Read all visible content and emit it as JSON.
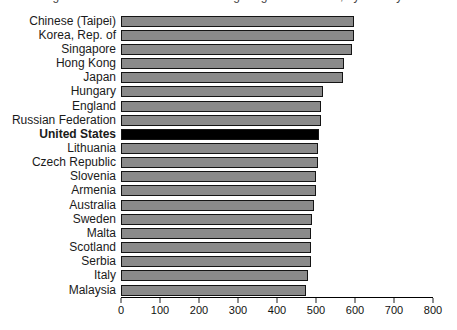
{
  "cropped_title": "Average mathematics scale scores of eighth-grade students, by country: 2007",
  "chart_data": {
    "type": "bar",
    "orientation": "horizontal",
    "title": "",
    "xlabel": "",
    "ylabel": "",
    "xlim": [
      0,
      800
    ],
    "x_ticks": [
      0,
      100,
      200,
      300,
      400,
      500,
      600,
      700,
      800
    ],
    "grid": "off",
    "legend": "none",
    "bar_color": "#8a8a8a",
    "bar_border_color": "#141414",
    "highlight_category": "United States",
    "highlight_color": "#000000",
    "categories": [
      "Chinese (Taipei)",
      "Korea, Rep. of",
      "Singapore",
      "Hong Kong",
      "Japan",
      "Hungary",
      "England",
      "Russian Federation",
      "United States",
      "Lithuania",
      "Czech Republic",
      "Slovenia",
      "Armenia",
      "Australia",
      "Sweden",
      "Malta",
      "Scotland",
      "Serbia",
      "Italy",
      "Malaysia"
    ],
    "values": [
      598,
      597,
      593,
      572,
      570,
      517,
      513,
      512,
      508,
      506,
      504,
      501,
      499,
      496,
      491,
      488,
      487,
      486,
      480,
      474
    ]
  }
}
